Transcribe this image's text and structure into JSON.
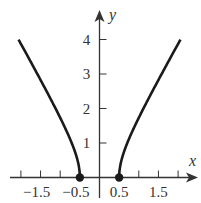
{
  "chart_data": {
    "type": "line",
    "title": "",
    "xlabel": "x",
    "ylabel": "y",
    "xlim": [
      -2.5,
      2.5
    ],
    "ylim": [
      -0.5,
      4.5
    ],
    "grid": false,
    "legend": null,
    "x_ticks": [
      -2,
      -1.5,
      -1,
      -0.5,
      0.5,
      1,
      1.5,
      2
    ],
    "x_tick_labels": [
      {
        "value": -1.5,
        "label": "−1.5"
      },
      {
        "value": -0.5,
        "label": "−0.5"
      },
      {
        "value": 0.5,
        "label": "0.5"
      },
      {
        "value": 1.5,
        "label": "1.5"
      }
    ],
    "y_ticks": [
      1,
      2,
      3,
      4
    ],
    "y_tick_labels": [
      {
        "value": 1,
        "label": "1"
      },
      {
        "value": 2,
        "label": "2"
      },
      {
        "value": 3,
        "label": "3"
      },
      {
        "value": 4,
        "label": "4"
      }
    ],
    "series": [
      {
        "name": "left branch",
        "x": [
          -2.06,
          -2.0,
          -1.75,
          -1.5,
          -1.25,
          -1.0,
          -0.75,
          -0.6,
          -0.5
        ],
        "y": [
          4.0,
          3.87,
          3.35,
          2.83,
          2.29,
          1.73,
          1.12,
          0.66,
          0.0
        ]
      },
      {
        "name": "right branch",
        "x": [
          0.5,
          0.6,
          0.75,
          1.0,
          1.25,
          1.5,
          1.75,
          2.0,
          2.06
        ],
        "y": [
          0.0,
          0.66,
          1.12,
          1.73,
          2.29,
          2.83,
          3.35,
          3.87,
          4.0
        ]
      }
    ],
    "points": [
      {
        "x": -0.5,
        "y": 0,
        "style": "filled-dot"
      },
      {
        "x": 0.5,
        "y": 0,
        "style": "filled-dot"
      }
    ],
    "curve_color": "#1a1a1a",
    "axis_color": "#333333"
  }
}
